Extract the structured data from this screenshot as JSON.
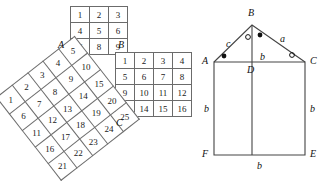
{
  "figure": {
    "background": "#ffffff",
    "ink": "#1a1a1a",
    "rule": "#6b6b6b"
  },
  "left_diagram": {
    "name": "three-squares-grids",
    "grid3": {
      "label": "3x3 grid",
      "rows": [
        [
          "1",
          "2",
          "3"
        ],
        [
          "4",
          "5",
          "6"
        ],
        [
          "7",
          "8",
          "9"
        ]
      ]
    },
    "grid4": {
      "label": "4x4 grid",
      "rows": [
        [
          "1",
          "2",
          "3",
          "4"
        ],
        [
          "5",
          "6",
          "7",
          "8"
        ],
        [
          "9",
          "10",
          "11",
          "12"
        ],
        [
          "13",
          "14",
          "15",
          "16"
        ]
      ]
    },
    "grid5": {
      "label": "5x5 tilted grid",
      "rotation_degrees": "-38",
      "rows": [
        [
          "1",
          "2",
          "3",
          "4",
          "5"
        ],
        [
          "6",
          "7",
          "8",
          "9",
          "10"
        ],
        [
          "11",
          "12",
          "13",
          "14",
          "15"
        ],
        [
          "16",
          "17",
          "18",
          "19",
          "20"
        ],
        [
          "21",
          "22",
          "23",
          "24",
          "25"
        ]
      ]
    },
    "vertex_labels": {
      "A": "A",
      "B": "B",
      "C": "C"
    }
  },
  "right_diagram": {
    "name": "triangle-on-rectangle",
    "vertex_labels": {
      "A": "A",
      "B": "B",
      "C": "C",
      "D": "D",
      "E": "E",
      "F": "F"
    },
    "side_labels": {
      "AB": "c",
      "BC": "a",
      "AD_DC": "b",
      "AF": "b",
      "CE": "b",
      "FE": "b"
    },
    "angle_marks": [
      {
        "at": "A",
        "mark": "filled-dot"
      },
      {
        "at": "ABD",
        "mark": "open-circle"
      },
      {
        "at": "DBC",
        "mark": "filled-dot"
      },
      {
        "at": "C",
        "mark": "open-circle"
      }
    ]
  }
}
